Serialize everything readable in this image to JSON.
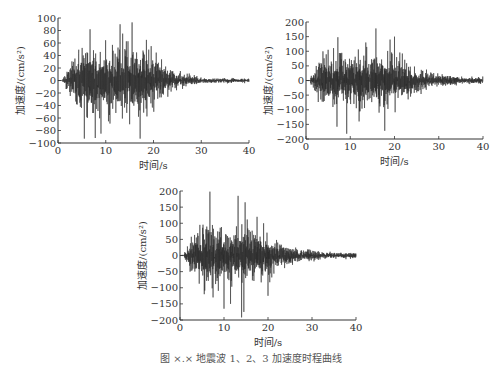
{
  "chart_data": [
    {
      "type": "line",
      "id": "wave1",
      "title": "",
      "xlabel": "时间/s",
      "ylabel": "加速度/(cm/s²)",
      "xlim": [
        0,
        40
      ],
      "ylim": [
        -100,
        100
      ],
      "xticks": [
        0,
        10,
        20,
        30,
        40
      ],
      "yticks": [
        100,
        80,
        60,
        40,
        20,
        0,
        -20,
        -40,
        -60,
        -80,
        -100
      ],
      "grid": false,
      "peak_positive": {
        "x": 15.5,
        "y": 93
      },
      "peak_negative": {
        "x": 5.5,
        "y": -93
      },
      "strong_motion_window_s": [
        4,
        22
      ],
      "envelope": {
        "rise_start": 1,
        "peak_start": 5,
        "peak_end": 19,
        "decay_end": 30,
        "max_amp": 60,
        "tail_amp": 4
      },
      "spikes": [
        [
          5.5,
          -93
        ],
        [
          6.7,
          82
        ],
        [
          7.8,
          -92
        ],
        [
          13.0,
          90
        ],
        [
          15.5,
          93
        ],
        [
          17.2,
          -93
        ],
        [
          15.0,
          -70
        ],
        [
          11.4,
          57
        ],
        [
          18.5,
          65
        ],
        [
          9.0,
          -85
        ],
        [
          19.5,
          55
        ],
        [
          14.2,
          48
        ]
      ],
      "seed": 11,
      "plot_box": {
        "left": 58,
        "top": 18,
        "right": 249,
        "bottom": 143
      }
    },
    {
      "type": "line",
      "id": "wave2",
      "title": "",
      "xlabel": "时间/s",
      "ylabel": "加速度/(cm/s²)",
      "xlim": [
        0,
        40
      ],
      "ylim": [
        -200,
        200
      ],
      "xticks": [
        0,
        10,
        20,
        30,
        40
      ],
      "yticks": [
        200,
        150,
        100,
        50,
        0,
        -50,
        -100,
        -150,
        -200
      ],
      "grid": false,
      "peak_positive": {
        "x": 15.8,
        "y": 178
      },
      "peak_negative": {
        "x": 9.2,
        "y": -182
      },
      "strong_motion_window_s": [
        3,
        24
      ],
      "envelope": {
        "rise_start": 1,
        "peak_start": 4,
        "peak_end": 21,
        "decay_end": 34,
        "max_amp": 95,
        "tail_amp": 12
      },
      "spikes": [
        [
          7.2,
          148
        ],
        [
          7.0,
          -158
        ],
        [
          9.2,
          -182
        ],
        [
          15.8,
          178
        ],
        [
          17.8,
          -172
        ],
        [
          20.0,
          150
        ],
        [
          12.0,
          -140
        ],
        [
          13.5,
          130
        ],
        [
          16.5,
          -110
        ],
        [
          19.0,
          140
        ],
        [
          5.0,
          105
        ]
      ],
      "seed": 23,
      "plot_box": {
        "left": 306,
        "top": 22,
        "right": 483,
        "bottom": 139
      }
    },
    {
      "type": "line",
      "id": "wave3",
      "title": "",
      "xlabel": "时间/s",
      "ylabel": "加速度/(cm/s²)",
      "xlim": [
        0,
        40
      ],
      "ylim": [
        -200,
        200
      ],
      "xticks": [
        0,
        10,
        20,
        30,
        40
      ],
      "yticks": [
        200,
        150,
        100,
        50,
        0,
        -50,
        -100,
        -150,
        -200
      ],
      "grid": false,
      "peak_positive": {
        "x": 6.8,
        "y": 198
      },
      "peak_negative": {
        "x": 14.0,
        "y": -192
      },
      "strong_motion_window_s": [
        3,
        22
      ],
      "envelope": {
        "rise_start": 1,
        "peak_start": 4,
        "peak_end": 19,
        "decay_end": 32,
        "max_amp": 95,
        "tail_amp": 10
      },
      "spikes": [
        [
          6.8,
          198
        ],
        [
          13.2,
          185
        ],
        [
          14.0,
          -192
        ],
        [
          14.5,
          -175
        ],
        [
          10.0,
          -165
        ],
        [
          11.5,
          -150
        ],
        [
          14.8,
          165
        ],
        [
          17.5,
          120
        ],
        [
          19.0,
          100
        ],
        [
          20.0,
          -125
        ],
        [
          5.5,
          -120
        ],
        [
          7.5,
          -130
        ],
        [
          4.5,
          95
        ]
      ],
      "seed": 37,
      "plot_box": {
        "left": 180,
        "top": 191,
        "right": 356,
        "bottom": 320
      }
    }
  ],
  "caption": "图 ×.× 地震波 1、2、3 加速度时程曲线"
}
